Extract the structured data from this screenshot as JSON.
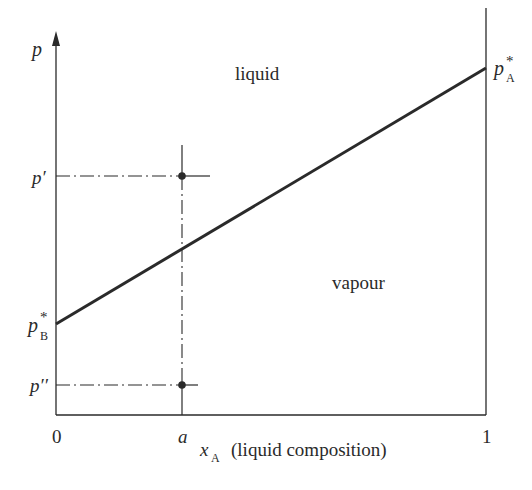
{
  "diagram": {
    "type": "pressure-composition phase diagram (ideal solution)",
    "axes": {
      "y_label": "p",
      "x_label_symbol": "x",
      "x_label_subscript": "A",
      "x_label_text": "(liquid composition)",
      "x_ticks": [
        {
          "label": "0",
          "value": 0
        },
        {
          "label": "a",
          "value": 0.29
        },
        {
          "label": "1",
          "value": 1
        }
      ]
    },
    "y_labels": {
      "p_prime": "p′",
      "p_double_prime": "p′′",
      "pB_base": "p",
      "pB_sup": "*",
      "pB_sub": "B",
      "pA_base": "p",
      "pA_sup": "*",
      "pA_sub": "A"
    },
    "regions": {
      "upper": "liquid",
      "lower": "vapour"
    },
    "line": {
      "description": "Raoult's law line from p*B at x_A=0 to p*A at x_A=1",
      "start": {
        "x": 0,
        "label": "p*B"
      },
      "end": {
        "x": 1,
        "label": "p*A"
      }
    },
    "points": [
      {
        "name": "upper point",
        "x": "a",
        "p": "p′"
      },
      {
        "name": "lower point",
        "x": "a",
        "p": "p′′"
      }
    ],
    "colors": {
      "ink": "#2a2a2a",
      "background": "#ffffff"
    }
  }
}
